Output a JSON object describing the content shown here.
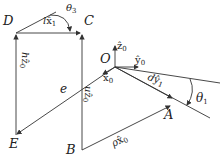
{
  "diagram": {
    "points": {
      "D": "D",
      "C": "C",
      "O": "O",
      "E": "E",
      "B": "B",
      "A": "A"
    },
    "vectors": {
      "lx1": {
        "base": "l",
        "vec": "x̂",
        "sub": "1"
      },
      "theta3": {
        "base": "θ",
        "sub": "3"
      },
      "hz0": {
        "base": "h",
        "vec": "ẑ",
        "sub": "0"
      },
      "z0": {
        "vec": "ẑ",
        "sub": "0"
      },
      "y0": {
        "vec": "ŷ",
        "sub": "0"
      },
      "x0": {
        "vec": "x̂",
        "sub": "0"
      },
      "e": {
        "base": "e"
      },
      "uz0": {
        "base": "u",
        "vec": "ẑ",
        "sub": "0"
      },
      "dy1": {
        "base": "d",
        "vec": "ŷ",
        "sub": "1"
      },
      "theta1": {
        "base": "θ",
        "sub": "1"
      },
      "rhox0": {
        "base": "ρ",
        "vec": "x̂",
        "sub": "0"
      }
    },
    "colors": {
      "stroke": "#333333",
      "background": "#ffffff"
    }
  }
}
